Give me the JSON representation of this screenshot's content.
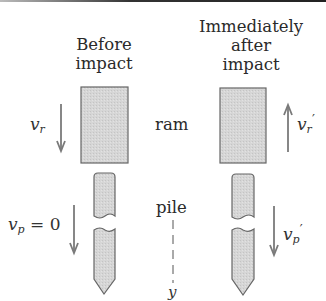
{
  "figure": {
    "before": {
      "heading_line1": "Before",
      "heading_line2": "impact",
      "ram_velocity": {
        "symbol": "v",
        "subscript": "r",
        "direction": "down"
      },
      "pile_velocity": {
        "symbol": "v",
        "subscript": "p",
        "suffix": " = 0",
        "direction": "down"
      }
    },
    "after": {
      "heading_line1": "Immediately",
      "heading_line2": "after",
      "heading_line3": "impact",
      "ram_velocity": {
        "symbol": "v",
        "subscript": "r",
        "prime": "′",
        "direction": "up"
      },
      "pile_velocity": {
        "symbol": "v",
        "subscript": "p",
        "prime": "′",
        "direction": "down"
      }
    },
    "labels": {
      "ram": "ram",
      "pile": "pile",
      "axis": "y"
    },
    "colors": {
      "body_fill": "#d4d4d4",
      "outline": "#666666",
      "arrow": "#7a7a7a"
    }
  }
}
